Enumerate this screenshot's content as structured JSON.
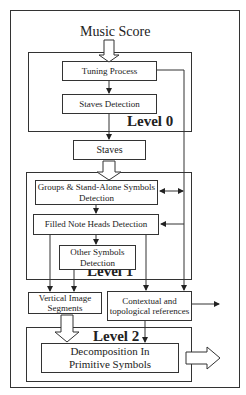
{
  "diagram": {
    "title": "Music Score",
    "levels": {
      "level0": "Level 0",
      "level1": "Level 1",
      "level2": "Level 2"
    },
    "nodes": {
      "tuning": "Tuning Process",
      "staves_detection": "Staves Detection",
      "staves": "Staves",
      "groups_line1": "Groups & Stand-Alone Symbols",
      "groups_line2": "Detection",
      "filled": "Filled Note Heads Detection",
      "other_line1": "Other Symbols",
      "other_line2": "Detection",
      "vertical_line1": "Vertical Image",
      "vertical_line2": "Segments",
      "contextual_line1": "Contextual and",
      "contextual_line2": "topological references",
      "decomp_line1": "Decomposition In",
      "decomp_line2": "Primitive Symbols"
    },
    "edges": [
      {
        "from": "Music Score",
        "to": "Tuning Process",
        "style": "hollow-arrow"
      },
      {
        "from": "Tuning Process",
        "to": "Staves Detection"
      },
      {
        "from": "Staves Detection",
        "to": "Staves"
      },
      {
        "from": "Staves",
        "to": "Groups & Stand-Alone Symbols Detection",
        "style": "hollow-arrow"
      },
      {
        "from": "Groups & Stand-Alone Symbols Detection",
        "to": "Filled Note Heads Detection"
      },
      {
        "from": "Filled Note Heads Detection",
        "to": "Other Symbols Detection"
      },
      {
        "from": "Tuning Process",
        "to": "Contextual and topological references"
      },
      {
        "from": "Contextual and topological references",
        "to": "Groups & Stand-Alone Symbols Detection",
        "style": "bidirectional"
      },
      {
        "from": "Contextual and topological references",
        "to": "Filled Note Heads Detection"
      },
      {
        "from": "Filled Note Heads Detection",
        "to": "Vertical Image Segments"
      },
      {
        "from": "Other Symbols Detection",
        "to": "Vertical Image Segments"
      },
      {
        "from": "Filled Note Heads Detection",
        "to": "Contextual and topological references"
      },
      {
        "from": "Vertical Image Segments",
        "to": "Decomposition In Primitive Symbols",
        "style": "hollow-arrow"
      },
      {
        "from": "Contextual and topological references",
        "to": "Decomposition In Primitive Symbols"
      },
      {
        "from": "Contextual and topological references",
        "to": "output"
      },
      {
        "from": "Decomposition In Primitive Symbols",
        "to": "output",
        "style": "hollow-arrow"
      }
    ]
  }
}
